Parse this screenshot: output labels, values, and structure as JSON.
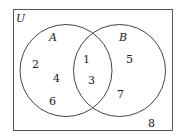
{
  "diagram": {
    "type": "venn",
    "universe_label": "U",
    "sets": [
      {
        "name": "A",
        "elements_only": [
          "2",
          "4",
          "6"
        ]
      },
      {
        "name": "B",
        "elements_only": [
          "5",
          "7"
        ]
      }
    ],
    "intersection": [
      "1",
      "3"
    ],
    "outside": [
      "8"
    ]
  },
  "labels": {
    "u": "U",
    "a": "A",
    "b": "B",
    "n2": "2",
    "n4": "4",
    "n6": "6",
    "n1": "1",
    "n3": "3",
    "n5": "5",
    "n7": "7",
    "n8": "8"
  }
}
